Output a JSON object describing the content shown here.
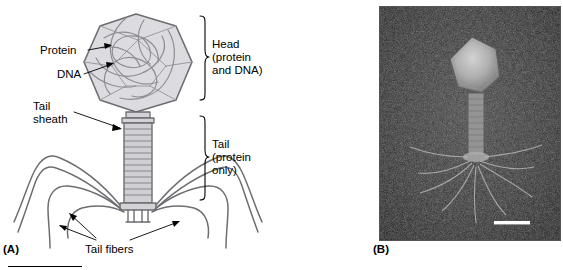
{
  "figure": {
    "panels": [
      {
        "letter": "(A)",
        "type": "schematic-diagram",
        "subject": "bacteriophage-structure"
      },
      {
        "letter": "(B)",
        "type": "electron-micrograph",
        "subject": "bacteriophage-negative-stain"
      }
    ]
  },
  "panel_a": {
    "letter": "(A)",
    "labels": {
      "protein": "Protein",
      "dna": "DNA",
      "tail_sheath": "Tail\nsheath",
      "head": "Head\n(protein\nand DNA)",
      "tail": "Tail\n(protein\nonly)",
      "tail_fibers": "Tail fibers"
    },
    "colors": {
      "outline": "#6e6e72",
      "capsid_fill": "#d8d8dc",
      "capsid_mesh": "#8d8d93",
      "sheath_fill": "#c9c9cf",
      "leader_line": "#000000"
    }
  },
  "panel_b": {
    "letter": "(B)",
    "colors": {
      "background": "#0d0d0d",
      "border": "#555555",
      "scale_bar": "#ffffff"
    },
    "scale_bar": ""
  }
}
